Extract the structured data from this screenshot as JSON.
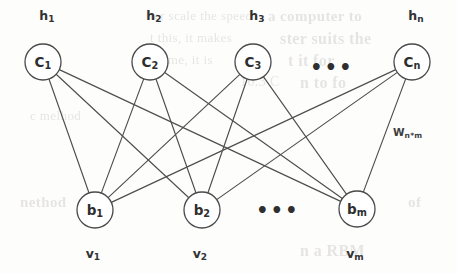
{
  "figure": {
    "type": "bipartite-graph",
    "canvas": {
      "width": 457,
      "height": 273
    },
    "ink_color": "#4a4a4a",
    "background_color": "#fdfdfc"
  },
  "hidden_layer": {
    "name": "hidden-layer",
    "nodes": [
      {
        "id": "c1",
        "node_label": "C",
        "node_sub": "1",
        "top_label": "h",
        "top_sub": "1",
        "cx": 43,
        "cy": 62,
        "r": 18
      },
      {
        "id": "c2",
        "node_label": "C",
        "node_sub": "2",
        "top_label": "h",
        "top_sub": "2",
        "cx": 150,
        "cy": 62,
        "r": 18
      },
      {
        "id": "c3",
        "node_label": "C",
        "node_sub": "3",
        "top_label": "h",
        "top_sub": "3",
        "cx": 253,
        "cy": 62,
        "r": 18
      },
      {
        "id": "cn",
        "node_label": "C",
        "node_sub": "n",
        "top_label": "h",
        "top_sub": "n",
        "cx": 412,
        "cy": 62,
        "r": 18
      }
    ],
    "ellipsis": {
      "text": "•••",
      "x": 332,
      "y": 67
    },
    "label_row_y": 17
  },
  "visible_layer": {
    "name": "visible-layer",
    "nodes": [
      {
        "id": "b1",
        "node_label": "b",
        "node_sub": "1",
        "bottom_label": "v",
        "bottom_sub": "1",
        "cx": 95,
        "cy": 210,
        "r": 18
      },
      {
        "id": "b2",
        "node_label": "b",
        "node_sub": "2",
        "bottom_label": "v",
        "bottom_sub": "2",
        "cx": 202,
        "cy": 210,
        "r": 18
      },
      {
        "id": "bm",
        "node_label": "b",
        "node_sub": "m",
        "bottom_label": "v",
        "bottom_sub": "m",
        "cx": 357,
        "cy": 209,
        "r": 18
      }
    ],
    "ellipsis": {
      "text": "•••",
      "x": 278,
      "y": 210
    },
    "label_row_y": 255
  },
  "weight_annotation": {
    "label": "W",
    "sub": "n*m",
    "x": 393,
    "y": 133
  },
  "edges": [
    {
      "from": "c1",
      "to": "b1"
    },
    {
      "from": "c1",
      "to": "b2"
    },
    {
      "from": "c1",
      "to": "bm"
    },
    {
      "from": "c2",
      "to": "b1"
    },
    {
      "from": "c2",
      "to": "b2"
    },
    {
      "from": "c2",
      "to": "bm"
    },
    {
      "from": "c3",
      "to": "b1"
    },
    {
      "from": "c3",
      "to": "b2"
    },
    {
      "from": "c3",
      "to": "bm"
    },
    {
      "from": "cn",
      "to": "b1"
    },
    {
      "from": "cn",
      "to": "b2"
    },
    {
      "from": "cn",
      "to": "bm"
    }
  ],
  "background_bleed": [
    {
      "text": "a computer to",
      "x": 268,
      "y": 8,
      "size": 15,
      "weight": 700
    },
    {
      "text": "ter scale  the speed",
      "x": 150,
      "y": 8,
      "size": 13,
      "weight": 400
    },
    {
      "text": "t this, it makes",
      "x": 150,
      "y": 30,
      "size": 13,
      "weight": 400
    },
    {
      "text": "ster suits the",
      "x": 280,
      "y": 30,
      "size": 16,
      "weight": 700
    },
    {
      "text": "e time, it is",
      "x": 150,
      "y": 52,
      "size": 13,
      "weight": 400
    },
    {
      "text": "t  it  for",
      "x": 288,
      "y": 52,
      "size": 16,
      "weight": 700
    },
    {
      "text": "n  to  fo",
      "x": 300,
      "y": 74,
      "size": 16,
      "weight": 700
    },
    {
      "text": "10.3  C",
      "x": 240,
      "y": 74,
      "size": 14,
      "weight": 400
    },
    {
      "text": "c  melhod",
      "x": 30,
      "y": 108,
      "size": 13,
      "weight": 400
    },
    {
      "text": "nethod",
      "x": 20,
      "y": 194,
      "size": 15,
      "weight": 700
    },
    {
      "text": "n  a  RBM",
      "x": 300,
      "y": 242,
      "size": 16,
      "weight": 700
    },
    {
      "text": "of",
      "x": 408,
      "y": 194,
      "size": 15,
      "weight": 700
    }
  ]
}
